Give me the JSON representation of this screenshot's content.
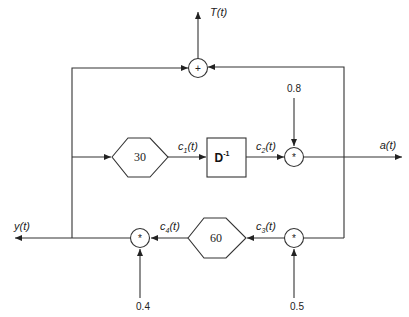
{
  "diagram": {
    "type": "block-diagram",
    "outputs": {
      "top": "T(t)",
      "right": "a(t)",
      "left": "y(t)"
    },
    "nodes": {
      "sum": {
        "op": "+"
      },
      "mult_mid": {
        "op": "*",
        "constant": "0.8"
      },
      "mult_bottom_right": {
        "op": "*",
        "constant": "0.5"
      },
      "mult_bottom_left": {
        "op": "*",
        "constant": "0.4"
      },
      "hex_top": {
        "value": "30"
      },
      "hex_bottom": {
        "value": "60"
      },
      "delay": {
        "label": "D",
        "exponent": "-1"
      }
    },
    "signals": {
      "c1": {
        "base": "c",
        "sub": "1",
        "arg": "(t)"
      },
      "c2": {
        "base": "c",
        "sub": "2",
        "arg": "(t)"
      },
      "c3": {
        "base": "c",
        "sub": "3",
        "arg": "(t)"
      },
      "c4": {
        "base": "c",
        "sub": "4",
        "arg": "(t)"
      }
    }
  }
}
